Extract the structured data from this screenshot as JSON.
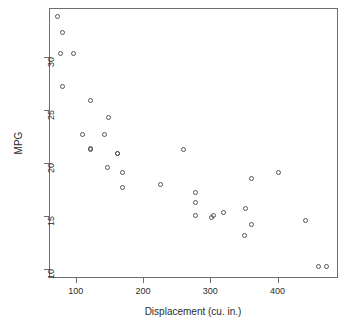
{
  "chart_data": {
    "type": "scatter",
    "title": "",
    "xlabel": "Displacement (cu. in.)",
    "ylabel": "MPG",
    "xlim": [
      60,
      490
    ],
    "ylim": [
      9.2,
      34.6
    ],
    "xticks": [
      100,
      200,
      300,
      400
    ],
    "yticks": [
      10,
      15,
      20,
      25,
      30
    ],
    "grid": false,
    "legend": null,
    "marker": "open-circle",
    "marker_color": "#555555",
    "x": [
      160,
      160,
      108,
      258,
      360,
      225,
      360,
      146.7,
      140.8,
      167.6,
      167.6,
      275.8,
      275.8,
      275.8,
      472,
      460,
      440,
      78.7,
      75.7,
      71.1,
      120.1,
      318,
      304,
      350,
      400,
      79,
      120.3,
      95.1,
      351,
      145,
      301,
      121
    ],
    "y": [
      21,
      21,
      22.8,
      21.4,
      18.7,
      18.1,
      14.3,
      24.4,
      22.8,
      19.2,
      17.8,
      16.4,
      17.3,
      15.2,
      10.4,
      10.4,
      14.7,
      32.4,
      30.4,
      33.9,
      21.5,
      15.5,
      15.2,
      13.3,
      19.2,
      27.3,
      26,
      30.4,
      15.8,
      19.7,
      15,
      21.4
    ]
  },
  "axis": {
    "x_tick_labels": [
      "100",
      "200",
      "300",
      "400"
    ],
    "y_tick_labels": [
      "10",
      "15",
      "20",
      "25",
      "30"
    ]
  }
}
